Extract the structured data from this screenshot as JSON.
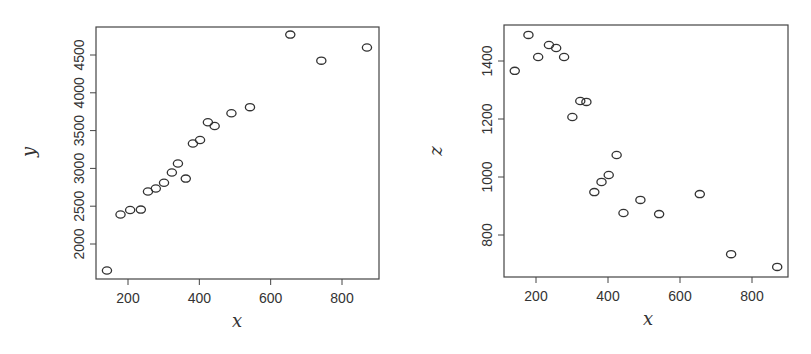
{
  "chart_data": [
    {
      "type": "scatter",
      "title": "",
      "xlabel": "x",
      "ylabel": "y",
      "xlim": [
        120,
        900
      ],
      "ylim": [
        1550,
        4870
      ],
      "x_ticks": [
        200,
        400,
        600,
        800
      ],
      "y_ticks": [
        2000,
        2500,
        3000,
        3500,
        4000,
        4500
      ],
      "grid": false,
      "legend": null,
      "marker": "open-circle",
      "x": [
        141,
        179,
        206,
        236,
        256,
        278,
        301,
        323,
        340,
        362,
        382,
        402,
        424,
        443,
        490,
        542,
        655,
        742,
        870
      ],
      "y": [
        1650,
        2390,
        2450,
        2455,
        2695,
        2735,
        2810,
        2945,
        3065,
        2865,
        3330,
        3375,
        3610,
        3560,
        3730,
        3810,
        4770,
        4425,
        4600
      ]
    },
    {
      "type": "scatter",
      "title": "",
      "xlabel": "x",
      "ylabel": "z",
      "xlim": [
        120,
        900
      ],
      "ylim": [
        650,
        1530
      ],
      "x_ticks": [
        200,
        400,
        600,
        800
      ],
      "y_ticks": [
        800,
        1000,
        1200,
        1400
      ],
      "grid": false,
      "legend": null,
      "marker": "open-circle",
      "x": [
        141,
        179,
        206,
        236,
        256,
        278,
        301,
        323,
        340,
        362,
        382,
        402,
        424,
        443,
        490,
        542,
        655,
        742,
        870
      ],
      "y": [
        1366,
        1490,
        1414,
        1455,
        1445,
        1414,
        1207,
        1262,
        1259,
        948,
        983,
        1007,
        1076,
        876,
        921,
        872,
        941,
        734,
        690
      ]
    }
  ],
  "panels": [
    {
      "xlabel": "x",
      "ylabel": "y",
      "x_tick_labels": [
        "200",
        "400",
        "600",
        "800"
      ],
      "y_tick_labels": [
        "2000",
        "2500",
        "3000",
        "3500",
        "4000",
        "4500"
      ]
    },
    {
      "xlabel": "x",
      "ylabel": "z",
      "x_tick_labels": [
        "200",
        "400",
        "600",
        "800"
      ],
      "y_tick_labels": [
        "800",
        "1000",
        "1200",
        "1400"
      ]
    }
  ],
  "style": {
    "axis_color": "#444444",
    "point_color": "#333333",
    "background": "#ffffff"
  }
}
